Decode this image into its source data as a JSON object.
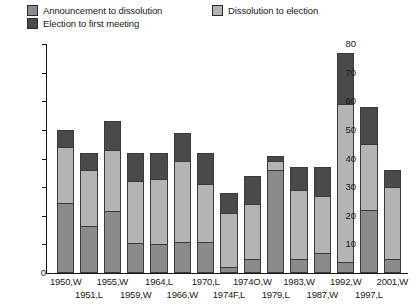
{
  "chart_data": {
    "type": "bar",
    "subtype": "stacked-vertical",
    "title": "",
    "xlabel": "",
    "ylabel": "",
    "ylim": [
      0,
      80
    ],
    "yticks": [
      0,
      10,
      20,
      30,
      40,
      50,
      60,
      70,
      80
    ],
    "grid": false,
    "legend_position": "top",
    "categories": [
      "1950,W",
      "1951,L",
      "1955,W",
      "1959,W",
      "1964,L",
      "1966,W",
      "1970,L",
      "1974F,L",
      "1974O,W",
      "1979,L",
      "1983,W",
      "1987,W",
      "1992,W",
      "1997,L",
      "2001,W"
    ],
    "category_rows": [
      0,
      1,
      0,
      1,
      0,
      1,
      0,
      1,
      0,
      1,
      0,
      1,
      0,
      1,
      0
    ],
    "series": [
      {
        "name": "Announcement to dissolution",
        "color": "#8a8a8a",
        "values": [
          24.5,
          16.5,
          21.5,
          10.5,
          10,
          11,
          11,
          2,
          5,
          36,
          5,
          7,
          4,
          22,
          5
        ]
      },
      {
        "name": "Dissolution to election",
        "color": "#b4b4b4",
        "values": [
          19.5,
          19.5,
          21.5,
          21.5,
          23,
          28,
          20,
          19,
          19,
          3,
          24,
          20,
          55,
          23,
          25
        ]
      },
      {
        "name": "Election to first meeting",
        "color": "#4a4a4a",
        "values": [
          6,
          6,
          10,
          10,
          9,
          10,
          11,
          7,
          10,
          2,
          8,
          10,
          18,
          13,
          6
        ]
      }
    ],
    "totals": [
      50,
      42,
      53,
      42,
      42,
      49,
      42,
      28,
      34,
      41,
      37,
      37,
      77,
      58,
      36
    ]
  },
  "legend": {
    "items": [
      {
        "label": "Announcement to dissolution",
        "swatch": "#8a8a8a"
      },
      {
        "label": "Election to first meeting",
        "swatch": "#4a4a4a"
      },
      {
        "label": "Dissolution to election",
        "swatch": "#b4b4b4"
      }
    ]
  },
  "axis": {
    "y_tick_labels": [
      "80",
      "70",
      "60",
      "50",
      "40",
      "30",
      "20",
      "10"
    ],
    "zero_label": "0"
  }
}
